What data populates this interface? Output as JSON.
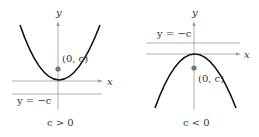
{
  "panels": [
    {
      "id": "left",
      "condition": "c > 0",
      "focus_label": "(0, c)",
      "directrix_label": "y = −c",
      "x_axis_label": "x",
      "y_axis_label": "y",
      "opens": "up"
    },
    {
      "id": "right",
      "condition": "c < 0",
      "focus_label": "(0, c)",
      "directrix_label": "y = −c",
      "x_axis_label": "x",
      "y_axis_label": "y",
      "opens": "down"
    }
  ],
  "colors": {
    "axis": "#9a9a9a",
    "curve": "#111111",
    "focus": "#777777",
    "text": "#333333"
  }
}
